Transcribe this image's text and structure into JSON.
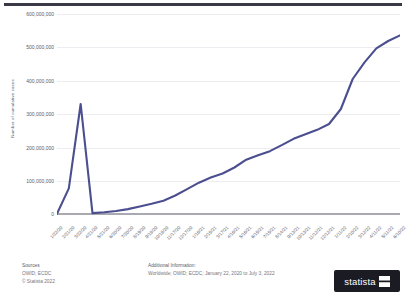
{
  "chart_data": {
    "type": "line",
    "title": "",
    "xlabel": "",
    "ylabel": "Number of cumulative cases",
    "ylim": [
      0,
      600000000
    ],
    "yticks": [
      0,
      100000000,
      200000000,
      300000000,
      400000000,
      500000000,
      600000000
    ],
    "ytick_labels": [
      "0",
      "100,000,000",
      "200,000,000",
      "300,000,000",
      "400,000,000",
      "500,000,000",
      "600,000,000"
    ],
    "grid": true,
    "legend": "none",
    "line_color": "#4b4f8f",
    "categories": [
      "1/22/20",
      "2/21/20",
      "3/22/20",
      "4/21/20",
      "5/21/20",
      "6/20/20",
      "7/20/20",
      "8/19/20",
      "9/18/20",
      "10/18/20",
      "11/17/20",
      "12/17/20",
      "1/16/21",
      "2/15/21",
      "3/17/21",
      "4/16/21",
      "5/16/21",
      "6/15/21",
      "7/15/21",
      "8/14/21",
      "9/13/21",
      "10/13/21",
      "11/12/21",
      "12/12/21",
      "1/11/22",
      "2/10/22",
      "3/12/22",
      "4/11/22",
      "5/11/22",
      "6/10/22"
    ],
    "series": [
      {
        "name": "Cumulative COVID-19 cases worldwide",
        "values": [
          580000,
          77000000,
          330000000,
          2550000,
          5100000,
          8800000,
          14700000,
          22500000,
          30500000,
          40000000,
          55500000,
          74500000,
          94000000,
          109500000,
          121500000,
          139500000,
          163000000,
          176500000,
          188500000,
          206500000,
          225500000,
          239000000,
          252500000,
          270000000,
          315000000,
          405000000,
          455000000,
          497000000,
          519000000,
          536000000
        ]
      }
    ],
    "final_value": 546000000,
    "date_range": "January 22, 2020 to July 3, 2022"
  },
  "footer": {
    "sources_heading": "Sources",
    "sources_value": "OWID; ECDC",
    "copyright": "© Statista 2022",
    "additional_heading": "Additional Information:",
    "additional_value": "Worldwide; OWID; ECDC; January 22, 2020 to July 3, 2022",
    "logo_text": "statista"
  }
}
